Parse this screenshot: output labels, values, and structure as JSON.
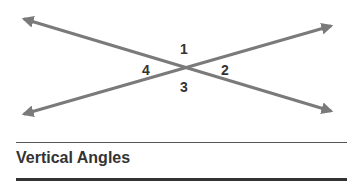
{
  "title": "Vertical Angles",
  "angle_labels": [
    "1",
    "2",
    "3",
    "4"
  ],
  "colors": {
    "line": "#7a7a7a",
    "text": "#333333"
  },
  "lines": [
    {
      "name": "line-a",
      "from": [
        22,
        18
      ],
      "to": [
        333,
        112
      ]
    },
    {
      "name": "line-b",
      "from": [
        22,
        115
      ],
      "to": [
        333,
        25
      ]
    }
  ],
  "intersection": [
    183,
    67
  ]
}
